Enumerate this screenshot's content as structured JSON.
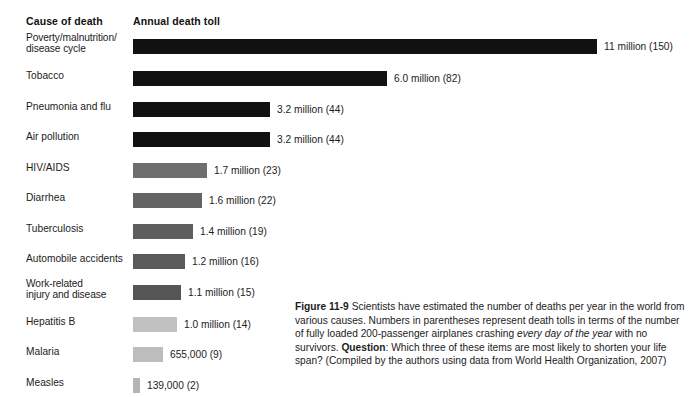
{
  "headers": {
    "cause": "Cause of death",
    "toll": "Annual death toll"
  },
  "chart_data": {
    "type": "bar",
    "orientation": "horizontal",
    "title": "",
    "xlabel": "Annual death toll",
    "ylabel": "Cause of death",
    "grid": false,
    "legend": "none",
    "xlim": [
      0,
      11
    ],
    "categories": [
      "Poverty/malnutrition/\ndisease cycle",
      "Tobacco",
      "Pneumonia and flu",
      "Air pollution",
      "HIV/AIDS",
      "Diarrhea",
      "Tuberculosis",
      "Automobile accidents",
      "Work-related\ninjury and disease",
      "Hepatitis B",
      "Malaria",
      "Measles"
    ],
    "values": [
      11,
      6.0,
      3.2,
      3.2,
      1.7,
      1.6,
      1.4,
      1.2,
      1.1,
      1.0,
      0.655,
      0.139
    ],
    "value_labels": [
      "11 million (150)",
      "6.0  million (82)",
      "3.2 million (44)",
      "3.2 million (44)",
      "1.7 million (23)",
      "1.6 million (22)",
      "1.4 million (19)",
      "1.2 million (16)",
      "1.1 million (15)",
      "1.0 million (14)",
      "655,000 (9)",
      "139,000 (2)"
    ],
    "airplanes_per_day": [
      150,
      82,
      44,
      44,
      23,
      22,
      19,
      16,
      15,
      14,
      9,
      2
    ],
    "bar_colors": [
      "#111111",
      "#111111",
      "#111111",
      "#111111",
      "#6e6e6e",
      "#646464",
      "#5e5e5e",
      "#5a5a5a",
      "#565656",
      "#c0c0c0",
      "#bdbdbd",
      "#b5b5b5"
    ],
    "bar_px_widths": [
      464,
      254,
      137,
      137,
      74,
      69,
      60,
      52,
      48,
      44,
      30,
      7
    ]
  },
  "caption": {
    "figure_number": "Figure 11-9",
    "text_1": " Scientists have estimated the number of deaths per year in the world from various causes. Numbers in parentheses represent death tolls in terms of the number of fully loaded 200-passenger airplanes crashing ",
    "emphasis": "every day of the year",
    "text_2": " with no survivors. ",
    "question_label": "Question",
    "text_3": ": Which three of these items are most likely to shorten your life span? (Compiled by the authors using data from World Health Organization, 2007)"
  }
}
